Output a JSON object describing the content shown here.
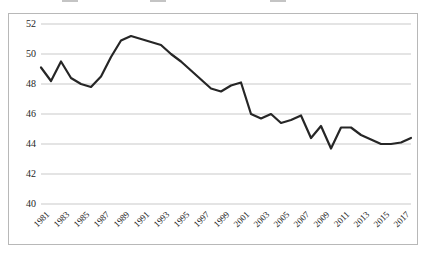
{
  "legend": {
    "visible_fragment": true,
    "note": "legend row is clipped by the top edge of the screenshot and is illegible",
    "entries": [
      {
        "label": "",
        "color": "#3a3a3a",
        "x": 62
      },
      {
        "label": "",
        "color": "#3a3a3a",
        "x": 150
      },
      {
        "label": "",
        "color": "#3a3a3a",
        "x": 270
      }
    ]
  },
  "chart_data": {
    "type": "line",
    "title": "",
    "xlabel": "",
    "ylabel": "",
    "ylim": [
      40,
      52
    ],
    "yticks": [
      40,
      42,
      44,
      46,
      48,
      50,
      52
    ],
    "xlim": [
      1981,
      2018
    ],
    "grid": true,
    "grid_axis": "y",
    "legend_position": "top",
    "line_color": "#262626",
    "line_width": 2.2,
    "xticks": [
      "1981",
      "1983",
      "1985",
      "1987",
      "1989",
      "1991",
      "1993",
      "1995",
      "1997",
      "1999",
      "2001",
      "2003",
      "2005",
      "2007",
      "2009",
      "2011",
      "2013",
      "2015",
      "2017"
    ],
    "x": [
      1981,
      1982,
      1983,
      1984,
      1985,
      1986,
      1987,
      1988,
      1989,
      1990,
      1991,
      1992,
      1993,
      1994,
      1995,
      1996,
      1997,
      1998,
      1999,
      2000,
      2001,
      2002,
      2003,
      2004,
      2005,
      2006,
      2007,
      2008,
      2009,
      2010,
      2011,
      2012,
      2013,
      2014,
      2015,
      2016,
      2017,
      2018
    ],
    "values": [
      49.1,
      48.2,
      49.5,
      48.4,
      48.0,
      47.8,
      48.5,
      49.8,
      50.9,
      51.2,
      51.0,
      50.8,
      50.6,
      50.0,
      49.5,
      48.9,
      48.3,
      47.7,
      47.5,
      47.9,
      48.1,
      46.0,
      45.7,
      46.0,
      45.4,
      45.6,
      45.9,
      44.4,
      45.2,
      43.7,
      45.1,
      45.1,
      44.6,
      44.3,
      44.0,
      44.0,
      44.1,
      44.4
    ],
    "series": [
      {
        "name": "",
        "values": [
          49.1,
          48.2,
          49.5,
          48.4,
          48.0,
          47.8,
          48.5,
          49.8,
          50.9,
          51.2,
          51.0,
          50.8,
          50.6,
          50.0,
          49.5,
          48.9,
          48.3,
          47.7,
          47.5,
          47.9,
          48.1,
          46.0,
          45.7,
          46.0,
          45.4,
          45.6,
          45.9,
          44.4,
          45.2,
          43.7,
          45.1,
          45.1,
          44.6,
          44.3,
          44.0,
          44.0,
          44.1,
          44.4
        ]
      }
    ],
    "annotations": []
  },
  "colors": {
    "line": "#262626",
    "grid": "#c9c9c9",
    "frame": "#b8b8b8",
    "text": "#262626",
    "background": "#ffffff"
  }
}
